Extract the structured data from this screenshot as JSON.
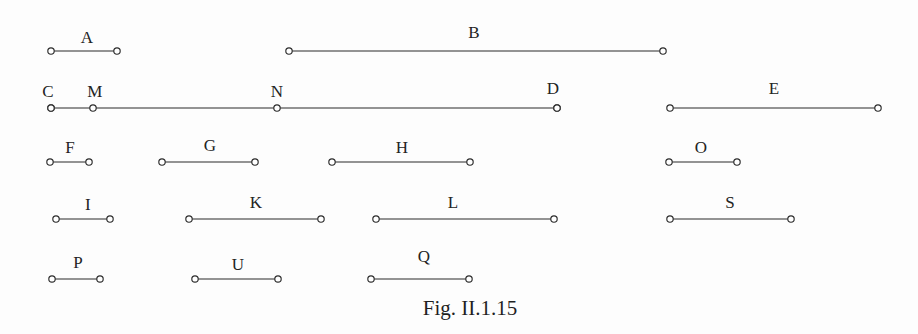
{
  "figure": {
    "caption": "Fig. II.1.15",
    "caption_x": 470,
    "caption_y": 298,
    "width": 918,
    "height": 334,
    "background_color": "#fdfdfd",
    "ink_color": "#2b2b2b",
    "label_color": "#232323",
    "endpoint_radius": 3.2
  },
  "chart_data": {
    "type": "diagram",
    "title": "Fig. II.1.15",
    "xlabel": "",
    "ylabel": "",
    "grid": false,
    "legend": "none",
    "rows": [
      {
        "row": 1,
        "y": 51,
        "segments": [
          {
            "name": "A",
            "x1": 51,
            "x2": 117,
            "length": 66,
            "label": "A",
            "label_x": 87,
            "label_y": 29
          },
          {
            "name": "B",
            "x1": 289,
            "x2": 663,
            "length": 374,
            "label": "B",
            "label_x": 474,
            "label_y": 24
          }
        ]
      },
      {
        "row": 2,
        "y": 108,
        "segments": [
          {
            "name": "CD",
            "x1": 51,
            "x2": 557,
            "length": 506,
            "label": "",
            "label_x": 0,
            "label_y": 0
          },
          {
            "name": "E",
            "x1": 670,
            "x2": 878,
            "length": 208,
            "label": "E",
            "label_x": 774,
            "label_y": 80
          }
        ],
        "interior_points": [
          {
            "name": "C",
            "x": 51,
            "label": "C",
            "label_x": 48,
            "label_y": 83
          },
          {
            "name": "M",
            "x": 93,
            "label": "M",
            "label_x": 95,
            "label_y": 83
          },
          {
            "name": "N",
            "x": 277,
            "label": "N",
            "label_x": 277,
            "label_y": 83
          },
          {
            "name": "D",
            "x": 557,
            "label": "D",
            "label_x": 553,
            "label_y": 80
          }
        ]
      },
      {
        "row": 3,
        "y": 162,
        "segments": [
          {
            "name": "F",
            "x1": 50,
            "x2": 89,
            "length": 39,
            "label": "F",
            "label_x": 70,
            "label_y": 139
          },
          {
            "name": "G",
            "x1": 162,
            "x2": 255,
            "length": 93,
            "label": "G",
            "label_x": 210,
            "label_y": 137
          },
          {
            "name": "H",
            "x1": 332,
            "x2": 470,
            "length": 138,
            "label": "H",
            "label_x": 402,
            "label_y": 139
          },
          {
            "name": "O",
            "x1": 669,
            "x2": 737,
            "length": 68,
            "label": "O",
            "label_x": 701,
            "label_y": 139
          }
        ]
      },
      {
        "row": 4,
        "y": 219,
        "segments": [
          {
            "name": "I",
            "x1": 56,
            "x2": 110,
            "length": 54,
            "label": "I",
            "label_x": 88,
            "label_y": 196
          },
          {
            "name": "K",
            "x1": 189,
            "x2": 321,
            "length": 132,
            "label": "K",
            "label_x": 256,
            "label_y": 194
          },
          {
            "name": "L",
            "x1": 376,
            "x2": 554,
            "length": 178,
            "label": "L",
            "label_x": 453,
            "label_y": 194
          },
          {
            "name": "S",
            "x1": 670,
            "x2": 791,
            "length": 121,
            "label": "S",
            "label_x": 730,
            "label_y": 194
          }
        ]
      },
      {
        "row": 5,
        "y": 279,
        "segments": [
          {
            "name": "P",
            "x1": 52,
            "x2": 100,
            "length": 48,
            "label": "P",
            "label_x": 78,
            "label_y": 254
          },
          {
            "name": "U",
            "x1": 195,
            "x2": 278,
            "length": 83,
            "label": "U",
            "label_x": 238,
            "label_y": 256
          },
          {
            "name": "Q",
            "x1": 371,
            "x2": 469,
            "length": 98,
            "label": "Q",
            "label_x": 424,
            "label_y": 248
          }
        ]
      }
    ]
  }
}
